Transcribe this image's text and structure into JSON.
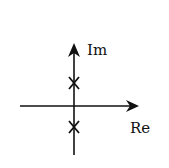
{
  "diagram": {
    "type": "pole-zero plot (complex s-plane)",
    "axes": {
      "imaginary_label": "Im",
      "real_label": "Re"
    },
    "poles": [
      {
        "label": "pole-upper",
        "marker": "x",
        "position": "positive imaginary axis"
      },
      {
        "label": "pole-lower",
        "marker": "x",
        "position": "negative imaginary axis"
      }
    ],
    "colors": {
      "stroke": "#111111",
      "background": "#ffffff"
    }
  }
}
